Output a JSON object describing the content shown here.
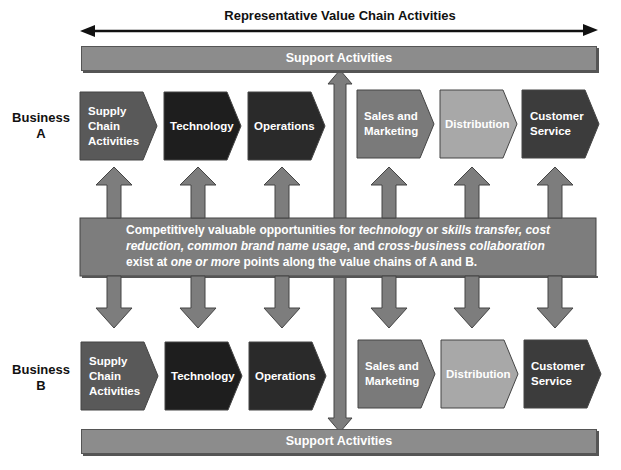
{
  "diagram": {
    "title": "Representative Value Chain Activities",
    "support_top": "Support Activities",
    "support_bottom": "Support Activities",
    "business_a": {
      "line1": "Business",
      "line2": "A"
    },
    "business_b": {
      "line1": "Business",
      "line2": "B"
    },
    "activities": [
      {
        "label": "Supply Chain Activities",
        "color": "#595959"
      },
      {
        "label": "Technology",
        "color": "#1e1e1e"
      },
      {
        "label": "Operations",
        "color": "#2a2a2a"
      },
      {
        "label": "Sales and Marketing",
        "color": "#7a7a7a"
      },
      {
        "label": "Distribution",
        "color": "#a8a8a8"
      },
      {
        "label": "Customer Service",
        "color": "#3c3c3c"
      }
    ],
    "middle_text": {
      "p1": "Competitively valuable opportunities for ",
      "i1": "technology",
      "p2": " or ",
      "i2": "skills transfer, cost reduction, common brand name usage",
      "p3": ", and ",
      "i3": "cross-business collaboration",
      "p4": " exist at ",
      "i4": "one or more",
      "p5": " points along the value chains of A and B."
    },
    "colors": {
      "arrow_gray": "#7d7d7d",
      "support_gray": "#8c8c8c",
      "outline": "#444444"
    }
  }
}
